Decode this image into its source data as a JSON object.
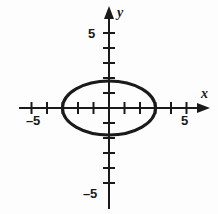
{
  "figure": {
    "title": "",
    "background_color": "#fdfdfd",
    "stroke_color": "#1a1a1a",
    "width": 218,
    "height": 214
  },
  "axes": {
    "x_axis_name": "x",
    "y_axis_name": "y",
    "x_labels": [
      {
        "text": "–5",
        "value": -5
      },
      {
        "text": "5",
        "value": 5
      }
    ],
    "y_labels": [
      {
        "text": "5",
        "value": 5
      },
      {
        "text": "–5",
        "value": -5
      }
    ]
  },
  "chart_data": {
    "type": "line",
    "title": "",
    "xlabel": "x",
    "ylabel": "y",
    "xlim": [
      -6,
      6
    ],
    "ylim": [
      -6.5,
      6.5
    ],
    "grid": false,
    "legend": null,
    "x_ticks": [
      -5,
      -4,
      -3,
      -2,
      -1,
      1,
      2,
      3,
      4,
      5
    ],
    "y_ticks": [
      -5,
      -4,
      -3,
      -2,
      -1,
      1,
      2,
      3,
      4,
      5
    ],
    "x_tick_labels_shown": [
      -5,
      5
    ],
    "y_tick_labels_shown": [
      -5,
      5
    ],
    "series": [
      {
        "name": "ellipse",
        "shape": "ellipse",
        "center": [
          0,
          0
        ],
        "semi_axis_x": 3.0,
        "semi_axis_y": 1.8,
        "equation": "x^2/9 + y^2/3.24 = 1",
        "stroke_width_px": 3,
        "closed": true,
        "x_intercepts": [
          -3,
          3
        ],
        "y_intercepts": [
          -1.8,
          1.8
        ]
      }
    ]
  }
}
